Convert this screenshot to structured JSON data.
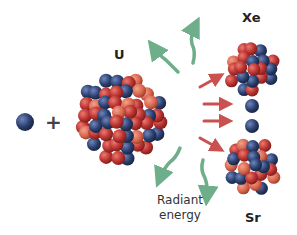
{
  "labels": {
    "uranium": "U",
    "xenon": "Xe",
    "strontium": "Sr",
    "plus": "+",
    "radiant_line1": "Radiant",
    "radiant_line2": "energy"
  },
  "colors": {
    "proton": "#b8322f",
    "proton_light": "#e0605a",
    "neutron": "#2b3f6e",
    "neutron_light": "#4d66a0",
    "radiant_arrow": "#6fae8a",
    "neutron_arrow": "#c9514f",
    "text": "#222222"
  }
}
